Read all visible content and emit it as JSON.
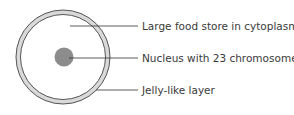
{
  "diagram": {
    "labels": [
      {
        "text": "Large food store in cytoplasm",
        "y": 22
      },
      {
        "text": "Nucleus with 23 chromosomes",
        "y": 54
      },
      {
        "text": "Jelly-like layer",
        "y": 86
      }
    ],
    "colors": {
      "ring_fill": "#d9d9d9",
      "ring_stroke": "#555555",
      "nucleus": "#8c8c8c",
      "line": "#333333",
      "text": "#3a3a3a"
    }
  }
}
